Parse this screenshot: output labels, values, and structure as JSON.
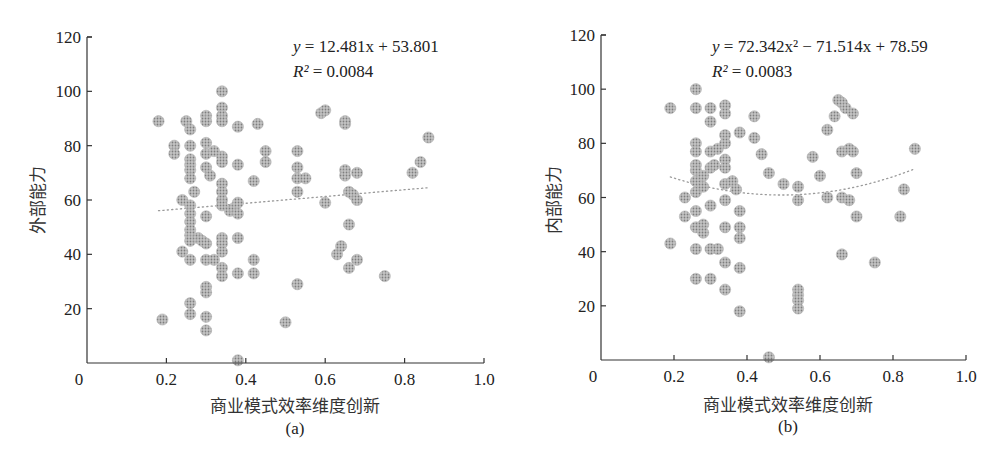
{
  "chart_data": [
    {
      "panel": "(a)",
      "type": "scatter",
      "xlabel": "商业模式效率维度创新",
      "ylabel": "外部能力",
      "xlim": [
        0,
        1.0
      ],
      "ylim": [
        0,
        120
      ],
      "x_ticks": [
        "0",
        "0.2",
        "0.4",
        "0.6",
        "0.8",
        "1.0"
      ],
      "y_ticks": [
        "20",
        "40",
        "60",
        "80",
        "100",
        "120"
      ],
      "grid": false,
      "trendline": {
        "type": "linear",
        "equation": "y = 12.481x + 53.801",
        "r_squared": "R² = 0.0084",
        "a": 12.481,
        "b": 53.801,
        "x_range": [
          0.18,
          0.86
        ]
      },
      "points": [
        [
          0.18,
          89
        ],
        [
          0.19,
          16
        ],
        [
          0.22,
          80
        ],
        [
          0.22,
          77
        ],
        [
          0.24,
          41
        ],
        [
          0.24,
          60
        ],
        [
          0.25,
          89
        ],
        [
          0.26,
          86
        ],
        [
          0.26,
          80
        ],
        [
          0.26,
          75
        ],
        [
          0.26,
          73
        ],
        [
          0.26,
          71
        ],
        [
          0.26,
          68
        ],
        [
          0.26,
          58
        ],
        [
          0.26,
          55
        ],
        [
          0.26,
          52
        ],
        [
          0.26,
          49
        ],
        [
          0.26,
          47
        ],
        [
          0.26,
          45
        ],
        [
          0.26,
          38
        ],
        [
          0.26,
          22
        ],
        [
          0.26,
          18
        ],
        [
          0.27,
          63
        ],
        [
          0.28,
          46
        ],
        [
          0.29,
          45
        ],
        [
          0.3,
          91
        ],
        [
          0.3,
          89
        ],
        [
          0.3,
          81
        ],
        [
          0.3,
          77
        ],
        [
          0.3,
          72
        ],
        [
          0.3,
          54
        ],
        [
          0.3,
          38
        ],
        [
          0.3,
          44
        ],
        [
          0.3,
          28
        ],
        [
          0.3,
          26
        ],
        [
          0.3,
          17
        ],
        [
          0.3,
          12
        ],
        [
          0.31,
          69
        ],
        [
          0.32,
          38
        ],
        [
          0.32,
          78
        ],
        [
          0.34,
          100
        ],
        [
          0.34,
          94
        ],
        [
          0.34,
          91
        ],
        [
          0.34,
          89
        ],
        [
          0.34,
          76
        ],
        [
          0.34,
          74
        ],
        [
          0.34,
          66
        ],
        [
          0.34,
          63
        ],
        [
          0.34,
          60
        ],
        [
          0.34,
          58
        ],
        [
          0.34,
          46
        ],
        [
          0.34,
          44
        ],
        [
          0.34,
          41
        ],
        [
          0.34,
          35
        ],
        [
          0.34,
          32
        ],
        [
          0.36,
          56
        ],
        [
          0.37,
          57
        ],
        [
          0.38,
          87
        ],
        [
          0.38,
          73
        ],
        [
          0.38,
          59
        ],
        [
          0.38,
          55
        ],
        [
          0.38,
          46
        ],
        [
          0.38,
          33
        ],
        [
          0.38,
          1
        ],
        [
          0.42,
          67
        ],
        [
          0.42,
          38
        ],
        [
          0.42,
          33
        ],
        [
          0.43,
          88
        ],
        [
          0.45,
          78
        ],
        [
          0.45,
          74
        ],
        [
          0.5,
          15
        ],
        [
          0.53,
          78
        ],
        [
          0.53,
          72
        ],
        [
          0.53,
          68
        ],
        [
          0.53,
          63
        ],
        [
          0.53,
          29
        ],
        [
          0.55,
          68
        ],
        [
          0.59,
          92
        ],
        [
          0.6,
          93
        ],
        [
          0.6,
          59
        ],
        [
          0.63,
          40
        ],
        [
          0.64,
          43
        ],
        [
          0.65,
          88
        ],
        [
          0.65,
          89
        ],
        [
          0.65,
          71
        ],
        [
          0.65,
          69
        ],
        [
          0.66,
          63
        ],
        [
          0.66,
          51
        ],
        [
          0.66,
          35
        ],
        [
          0.67,
          62
        ],
        [
          0.68,
          60
        ],
        [
          0.68,
          70
        ],
        [
          0.68,
          38
        ],
        [
          0.75,
          32
        ],
        [
          0.82,
          70
        ],
        [
          0.84,
          74
        ],
        [
          0.86,
          83
        ]
      ]
    },
    {
      "panel": "(b)",
      "type": "scatter",
      "xlabel": "商业模式效率维度创新",
      "ylabel": "内部能力",
      "xlim": [
        0,
        1.0
      ],
      "ylim": [
        0,
        120
      ],
      "x_ticks": [
        "0",
        "0.2",
        "0.4",
        "0.6",
        "0.8",
        "1.0"
      ],
      "y_ticks": [
        "20",
        "40",
        "60",
        "80",
        "100",
        "120"
      ],
      "grid": false,
      "trendline": {
        "type": "polynomial",
        "equation": "y = 72.342x² − 71.514x + 78.59",
        "r_squared": "R² = 0.0083",
        "a": 72.342,
        "b": -71.514,
        "c": 78.59,
        "x_range": [
          0.19,
          0.86
        ]
      },
      "points": [
        [
          0.19,
          93
        ],
        [
          0.19,
          43
        ],
        [
          0.23,
          60
        ],
        [
          0.23,
          53
        ],
        [
          0.26,
          100
        ],
        [
          0.26,
          93
        ],
        [
          0.26,
          80
        ],
        [
          0.26,
          77
        ],
        [
          0.26,
          72
        ],
        [
          0.26,
          70
        ],
        [
          0.26,
          66
        ],
        [
          0.26,
          62
        ],
        [
          0.26,
          55
        ],
        [
          0.26,
          49
        ],
        [
          0.26,
          41
        ],
        [
          0.26,
          30
        ],
        [
          0.28,
          68
        ],
        [
          0.28,
          64
        ],
        [
          0.28,
          50
        ],
        [
          0.28,
          47
        ],
        [
          0.3,
          93
        ],
        [
          0.3,
          88
        ],
        [
          0.3,
          77
        ],
        [
          0.3,
          71
        ],
        [
          0.3,
          57
        ],
        [
          0.3,
          41
        ],
        [
          0.3,
          30
        ],
        [
          0.31,
          72
        ],
        [
          0.32,
          78
        ],
        [
          0.32,
          41
        ],
        [
          0.34,
          94
        ],
        [
          0.34,
          91
        ],
        [
          0.34,
          83
        ],
        [
          0.34,
          80
        ],
        [
          0.34,
          74
        ],
        [
          0.34,
          71
        ],
        [
          0.34,
          65
        ],
        [
          0.34,
          59
        ],
        [
          0.34,
          49
        ],
        [
          0.34,
          36
        ],
        [
          0.34,
          26
        ],
        [
          0.36,
          66
        ],
        [
          0.37,
          63
        ],
        [
          0.38,
          84
        ],
        [
          0.38,
          55
        ],
        [
          0.38,
          49
        ],
        [
          0.38,
          45
        ],
        [
          0.38,
          34
        ],
        [
          0.38,
          18
        ],
        [
          0.42,
          90
        ],
        [
          0.42,
          82
        ],
        [
          0.44,
          76
        ],
        [
          0.46,
          69
        ],
        [
          0.46,
          1
        ],
        [
          0.5,
          65
        ],
        [
          0.54,
          64
        ],
        [
          0.54,
          59
        ],
        [
          0.54,
          26
        ],
        [
          0.54,
          24
        ],
        [
          0.54,
          22
        ],
        [
          0.54,
          19
        ],
        [
          0.58,
          75
        ],
        [
          0.6,
          68
        ],
        [
          0.62,
          60
        ],
        [
          0.62,
          85
        ],
        [
          0.64,
          90
        ],
        [
          0.65,
          96
        ],
        [
          0.66,
          95
        ],
        [
          0.66,
          77
        ],
        [
          0.66,
          60
        ],
        [
          0.66,
          39
        ],
        [
          0.67,
          93
        ],
        [
          0.68,
          78
        ],
        [
          0.68,
          59
        ],
        [
          0.69,
          91
        ],
        [
          0.69,
          77
        ],
        [
          0.7,
          69
        ],
        [
          0.7,
          53
        ],
        [
          0.75,
          36
        ],
        [
          0.82,
          53
        ],
        [
          0.83,
          63
        ],
        [
          0.86,
          78
        ]
      ]
    }
  ],
  "panels": {
    "a": {
      "equation_prefix": "y",
      "equation_rest": " = 12.481x + 53.801",
      "r2_prefix": "R²",
      "r2_rest": " = 0.0084",
      "ylabel": "外部能力",
      "xlabel": "商业模式效率维度创新",
      "sub_label": "(a)"
    },
    "b": {
      "equation_prefix": "y",
      "equation_rest": " = 72.342x² − 71.514x + 78.59",
      "r2_prefix": "R²",
      "r2_rest": " = 0.0083",
      "ylabel": "内部能力",
      "xlabel": "商业模式效率维度创新",
      "sub_label": "(b)"
    }
  },
  "ticks": {
    "x": [
      "0",
      "0.2",
      "0.4",
      "0.6",
      "0.8",
      "1.0"
    ],
    "y": [
      "20",
      "40",
      "60",
      "80",
      "100",
      "120"
    ]
  },
  "colors": {
    "point_fill": "#a8a8a8",
    "point_dot": "#8a8a8a",
    "axis": "#333333",
    "trendline": "#9a9a9a"
  }
}
